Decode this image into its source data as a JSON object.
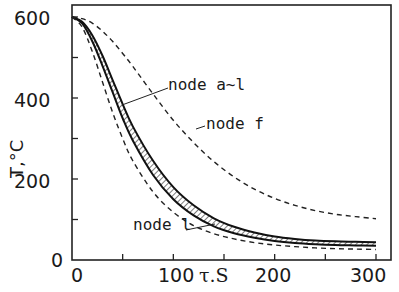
{
  "chart_data": {
    "type": "line",
    "title": "",
    "xlabel": "τ, s",
    "ylabel": "T, °C",
    "xlim": [
      0,
      300
    ],
    "ylim": [
      0,
      600
    ],
    "x_ticks": [
      0,
      100,
      200,
      300
    ],
    "x_minor_ticks": [
      50,
      150,
      250
    ],
    "y_ticks": [
      0,
      200,
      400,
      600
    ],
    "y_minor_ticks": [
      100,
      300,
      500
    ],
    "grid": false,
    "legend": "none (inline annotations)",
    "x": [
      0,
      10,
      20,
      30,
      40,
      50,
      60,
      80,
      100,
      120,
      140,
      160,
      180,
      200,
      220,
      240,
      260,
      280,
      300
    ],
    "series": [
      {
        "name": "node f",
        "style": "dashed",
        "values": [
          600,
          596,
          585,
          565,
          540,
          510,
          478,
          410,
          345,
          290,
          243,
          205,
          175,
          152,
          135,
          122,
          113,
          107,
          102
        ]
      },
      {
        "name": "node a~l (upper bound)",
        "style": "solid",
        "values": [
          600,
          588,
          555,
          505,
          445,
          385,
          330,
          245,
          180,
          135,
          103,
          82,
          68,
          58,
          52,
          48,
          46,
          45,
          44
        ]
      },
      {
        "name": "node a~l (lower bound)",
        "style": "solid",
        "values": [
          600,
          584,
          540,
          480,
          415,
          350,
          295,
          210,
          150,
          110,
          83,
          66,
          55,
          47,
          42,
          39,
          37,
          36,
          35
        ]
      },
      {
        "name": "node l",
        "style": "dashed",
        "values": [
          600,
          575,
          515,
          440,
          365,
          300,
          245,
          168,
          118,
          85,
          65,
          52,
          43,
          37,
          33,
          30,
          28,
          27,
          26
        ]
      }
    ],
    "annotations": [
      {
        "text": "node a~l",
        "points_to": "hatched band between upper and lower bounds"
      },
      {
        "text": "node f",
        "points_to": "upper dashed curve"
      },
      {
        "text": "node l",
        "points_to": "lower dashed curve"
      }
    ]
  },
  "labels": {
    "y_ticks": [
      "600",
      "400",
      "200",
      "0"
    ],
    "x_ticks": [
      "0",
      "100",
      "200",
      "300"
    ],
    "xlabel": "τ.S",
    "ylabel": "T,°C",
    "ann_al": "node a~l",
    "ann_f": "node f",
    "ann_l": "node l"
  }
}
